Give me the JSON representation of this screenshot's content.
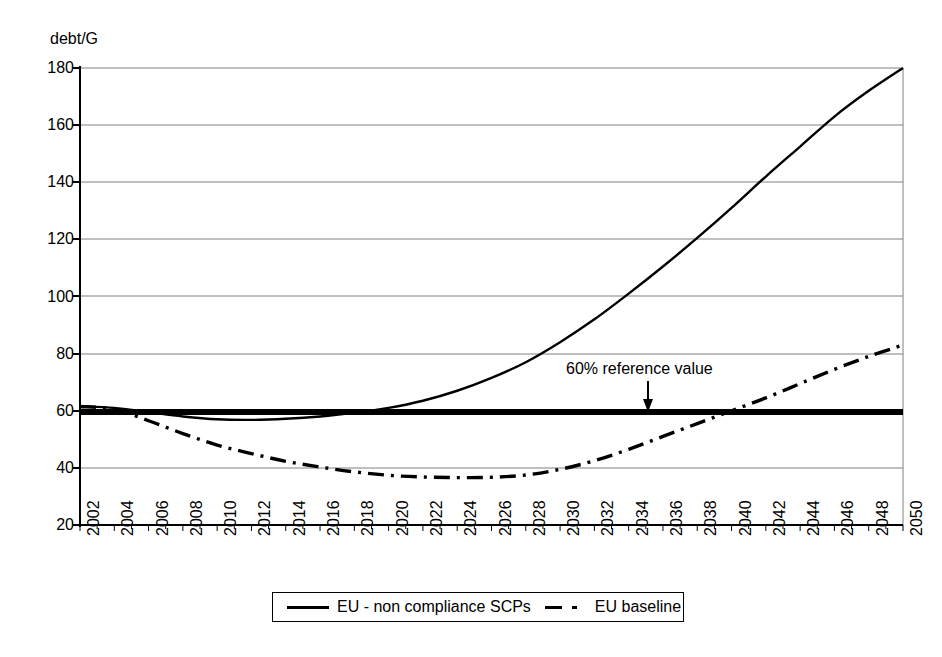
{
  "chart_data": {
    "type": "line",
    "title": "",
    "subtitle": "",
    "xlabel": "",
    "ylabel": "debt/G",
    "ylim": [
      20,
      180
    ],
    "xlim": [
      2002,
      2050
    ],
    "ytick_step": 20,
    "xtick_step": 2,
    "grid": "horizontal",
    "legend_position": "bottom",
    "yticks": [
      "180",
      "160",
      "140",
      "120",
      "100",
      "80",
      "60",
      "40",
      "20"
    ],
    "xticks": [
      "2002",
      "2004",
      "2006",
      "2008",
      "2010",
      "2012",
      "2014",
      "2016",
      "2018",
      "2020",
      "2022",
      "2024",
      "2026",
      "2028",
      "2030",
      "2032",
      "2034",
      "2036",
      "2038",
      "2040",
      "2042",
      "2044",
      "2046",
      "2048",
      "2050"
    ],
    "x": [
      2002,
      2004,
      2006,
      2008,
      2010,
      2012,
      2014,
      2016,
      2018,
      2020,
      2022,
      2024,
      2026,
      2028,
      2030,
      2032,
      2034,
      2036,
      2038,
      2040,
      2042,
      2044,
      2046,
      2048,
      2050
    ],
    "series": [
      {
        "name": "EU - non compliance SCPs",
        "style": "solid",
        "color": "#000000",
        "values": [
          61.5,
          61.0,
          59.5,
          58.0,
          57.0,
          56.8,
          57.2,
          58.0,
          59.3,
          61.0,
          63.5,
          67.0,
          71.5,
          77.0,
          84.0,
          92.0,
          101.0,
          110.5,
          120.5,
          131.0,
          142.0,
          152.5,
          163.0,
          172.0,
          180.0
        ]
      },
      {
        "name": "EU baseline",
        "style": "dash-dot",
        "color": "#000000",
        "values": [
          61.5,
          60.5,
          56.5,
          52.0,
          48.0,
          45.0,
          42.3,
          40.3,
          38.6,
          37.4,
          36.8,
          36.6,
          36.7,
          37.5,
          39.5,
          42.5,
          46.5,
          51.0,
          55.5,
          60.0,
          64.5,
          69.5,
          74.5,
          79.0,
          83.0
        ]
      }
    ],
    "reference_line": {
      "label": "60% reference value",
      "value": 61,
      "style": "thick-solid",
      "color": "#000000"
    },
    "annotations": [
      {
        "text": "60% reference value",
        "x": 2035,
        "y": 74,
        "arrow": "down",
        "arrow_target_y": 61
      }
    ]
  },
  "legend": {
    "items": [
      {
        "label": "EU - non compliance SCPs",
        "key": "solid-line-key"
      },
      {
        "label": "EU baseline",
        "key": "dashdot-line-key"
      }
    ]
  }
}
